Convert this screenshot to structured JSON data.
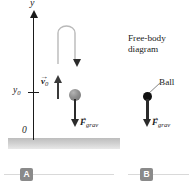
{
  "figure": {
    "panels": [
      {
        "id": "A",
        "badge_label": "A",
        "axis": {
          "axis_label": "y",
          "tick_label": "y0",
          "origin_label": "0"
        },
        "vectors": [
          {
            "name": "initial-velocity",
            "symbol": "v",
            "subscript": "0",
            "direction": "up"
          },
          {
            "name": "gravitational-force",
            "symbol": "F",
            "subscript": "grav",
            "direction": "down"
          }
        ],
        "ball_color": "#8e8e8e",
        "ground_color": "#cfcfcf"
      },
      {
        "id": "B",
        "badge_label": "B",
        "title_line1": "Free-body",
        "title_line2": "diagram",
        "ball_label": "Ball",
        "ball_color": "#111111",
        "vectors": [
          {
            "name": "gravitational-force",
            "symbol": "F",
            "subscript": "grav",
            "direction": "down"
          }
        ]
      }
    ],
    "labels": {
      "y_axis": "y",
      "y_naught": "y",
      "y_naught_sub": "0",
      "origin": "0",
      "v_symbol": "v",
      "v_sub": "0",
      "f_symbol": "F",
      "f_sub": "grav",
      "vector_bar": "→",
      "fbd_line1": "Free-body",
      "fbd_line2": "diagram",
      "ball": "Ball",
      "badge_a": "A",
      "badge_b": "B"
    },
    "colors": {
      "ink": "#1a1a1a",
      "arrow": "#2b2b2b",
      "ball_a": "#8e8e8e",
      "ball_b": "#111111",
      "ground": "#cfcfcf",
      "badge": "#8a8a8a",
      "rule": "#d9d9d9",
      "background": "#ffffff"
    }
  }
}
